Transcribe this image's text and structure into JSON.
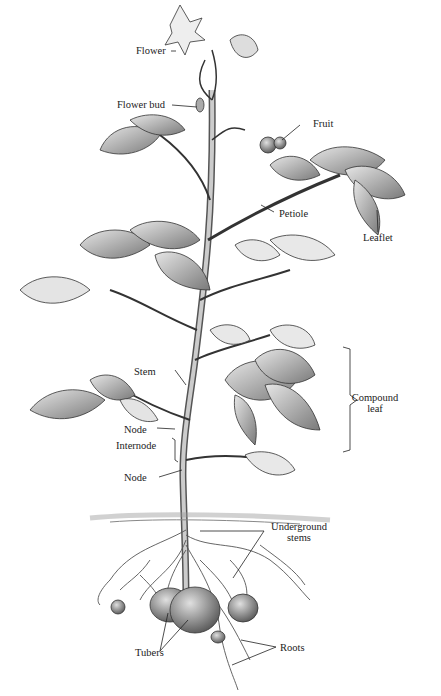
{
  "diagram": {
    "labels": {
      "flower": "Flower",
      "flower_bud": "Flower bud",
      "fruit": "Fruit",
      "petiole": "Petiole",
      "leaflet": "Leaflet",
      "stem": "Stem",
      "node_upper": "Node",
      "internode": "Internode",
      "node_lower": "Node",
      "compound_leaf_1": "Compound",
      "compound_leaf_2": "leaf",
      "underground_stems_1": "Underground",
      "underground_stems_2": "stems",
      "tubers": "Tubers",
      "roots": "Roots"
    },
    "colors": {
      "ink": "#222222",
      "leaf_fill": "#bdbdbd",
      "leaf_dark": "#6e6e6e",
      "tuber_fill": "#9a9a9a",
      "background": "#ffffff"
    }
  }
}
